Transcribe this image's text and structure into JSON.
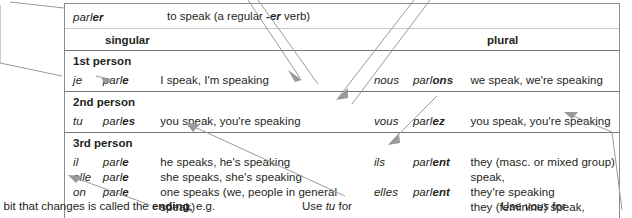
{
  "table": {
    "infinitive": {
      "verb": "parler",
      "verb_stem": "parl",
      "verb_ending": "er",
      "gloss_pre": "to speak (a regular ",
      "gloss_ending": "-er",
      "gloss_post": " verb)"
    },
    "column_headers": {
      "singular": "singular",
      "plural": "plural"
    },
    "groups": [
      {
        "person": "1st person",
        "singular": [
          {
            "pronoun": "je",
            "stem": "parl",
            "ending": "e",
            "gloss": "I speak, I'm speaking"
          }
        ],
        "plural": [
          {
            "pronoun": "nous",
            "stem": "parl",
            "ending": "ons",
            "gloss": "we speak, we're speaking"
          }
        ]
      },
      {
        "person": "2nd person",
        "singular": [
          {
            "pronoun": "tu",
            "stem": "parl",
            "ending": "es",
            "gloss": "you speak, you're speaking"
          }
        ],
        "plural": [
          {
            "pronoun": "vous",
            "stem": "parl",
            "ending": "ez",
            "gloss": "you speak, you're speaking"
          }
        ]
      },
      {
        "person": "3rd person",
        "singular": [
          {
            "pronoun": "il",
            "stem": "parl",
            "ending": "e",
            "gloss": "he speaks, he's speaking"
          },
          {
            "pronoun": "elle",
            "stem": "parl",
            "ending": "e",
            "gloss": "she speaks, she's speaking"
          },
          {
            "pronoun": "on",
            "stem": "parl",
            "ending": "e",
            "gloss": "one speaks (we, people in general speak)"
          }
        ],
        "plural": [
          {
            "pronoun": "ils",
            "stem": "parl",
            "ending": "ent",
            "gloss_line1": "they (masc. or mixed group) speak,",
            "gloss_line2": "they're speaking"
          },
          {
            "pronoun": "elles",
            "stem": "parl",
            "ending": "ent",
            "gloss_line1": "they (feminine) speak, they're speaking",
            "gloss_line2": ""
          }
        ]
      }
    ]
  },
  "notes": {
    "ending_note_pre": "e bit that changes is called the ",
    "ending_note_bold": "ending",
    "ending_note_post": ", e.g.",
    "tu_note_pre": "Use ",
    "tu_note_italic": "tu",
    "tu_note_post": " for",
    "vous_note_pre": "Use ",
    "vous_note_italic": "vous",
    "vous_note_post": " for"
  },
  "colors": {
    "text": "#231f20",
    "table_border": "#8d8d8d",
    "rule_thin": "#c9c9c9",
    "rule_thick": "#77777a",
    "leader_line": "#9a9a9e"
  }
}
